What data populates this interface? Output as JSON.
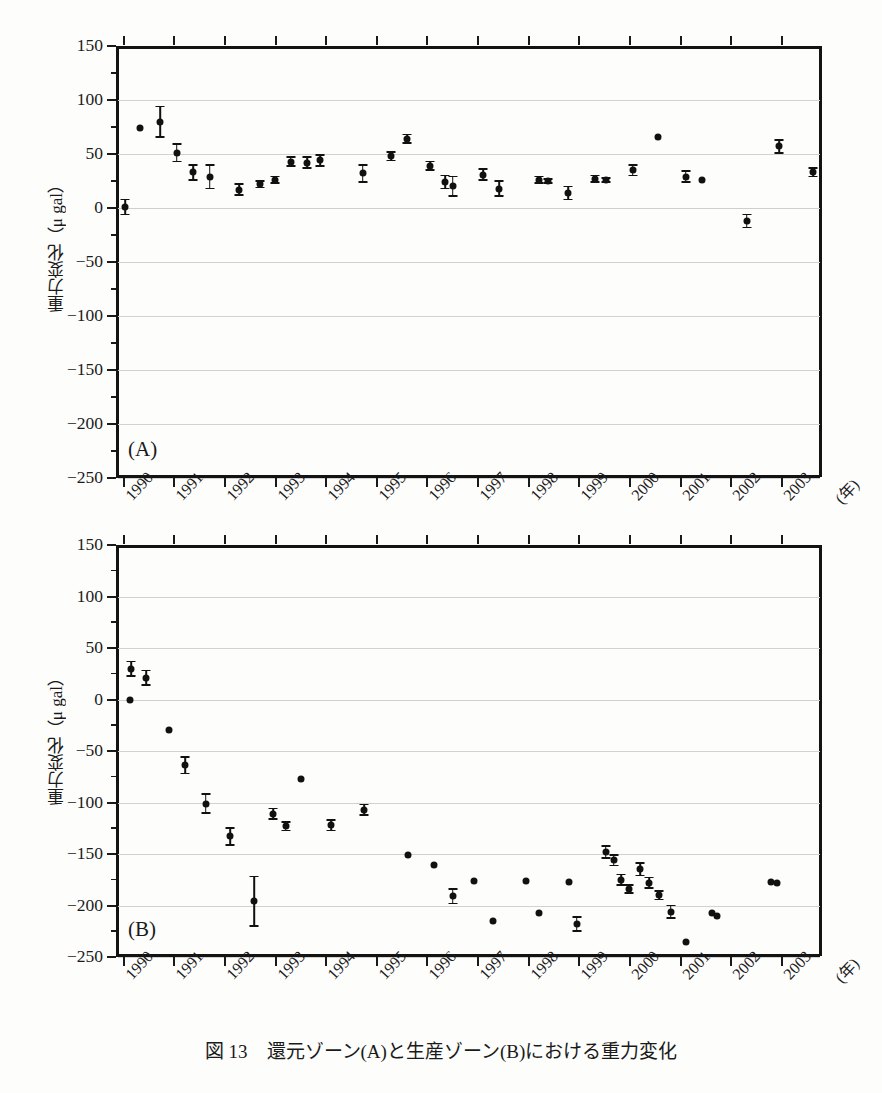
{
  "figure": {
    "caption": "図 13　還元ゾーン(A)と生産ゾーン(B)における重力変化",
    "cut_header_text": "",
    "axis_title_y": "重力変化（μ gal）",
    "unit_x": "(年)"
  },
  "panels": [
    {
      "tag": "(A)",
      "name": "reinjection-zone"
    },
    {
      "tag": "(B)",
      "name": "production-zone"
    }
  ],
  "axes": {
    "y_ticks": [
      "150",
      "100",
      "50",
      "0",
      "-50",
      "-100",
      "-150",
      "-200",
      "-250"
    ],
    "y_values": [
      150,
      100,
      50,
      0,
      -50,
      -100,
      -150,
      -200,
      -250
    ],
    "x_ticks": [
      "1990",
      "1991",
      "1992",
      "1993",
      "1994",
      "1995",
      "1996",
      "1997",
      "1998",
      "1999",
      "2000",
      "2001",
      "2002",
      "2003"
    ],
    "x_values": [
      1990,
      1991,
      1992,
      1993,
      1994,
      1995,
      1996,
      1997,
      1998,
      1999,
      2000,
      2001,
      2002,
      2003
    ]
  },
  "chart_data": [
    {
      "type": "scatter",
      "title": "(A) 還元ゾーン",
      "xlabel": "(年)",
      "ylabel": "重力変化（μ gal）",
      "xlim": [
        1989.85,
        2003.75
      ],
      "ylim": [
        -250,
        150
      ],
      "grid": true,
      "legend": "none",
      "errorbars": true,
      "points": [
        {
          "x": 1990.03,
          "y": 1,
          "yerr": 7
        },
        {
          "x": 1990.33,
          "y": 74,
          "yerr": 0
        },
        {
          "x": 1990.72,
          "y": 80,
          "yerr": 14
        },
        {
          "x": 1991.05,
          "y": 51,
          "yerr": 8
        },
        {
          "x": 1991.38,
          "y": 33,
          "yerr": 7
        },
        {
          "x": 1991.7,
          "y": 29,
          "yerr": 11
        },
        {
          "x": 1992.28,
          "y": 17,
          "yerr": 5
        },
        {
          "x": 1992.7,
          "y": 22,
          "yerr": 3
        },
        {
          "x": 1992.98,
          "y": 26,
          "yerr": 3
        },
        {
          "x": 1993.3,
          "y": 43,
          "yerr": 4
        },
        {
          "x": 1993.62,
          "y": 42,
          "yerr": 5
        },
        {
          "x": 1993.88,
          "y": 44,
          "yerr": 5
        },
        {
          "x": 1994.72,
          "y": 32,
          "yerr": 8
        },
        {
          "x": 1995.28,
          "y": 48,
          "yerr": 4
        },
        {
          "x": 1995.6,
          "y": 64,
          "yerr": 4
        },
        {
          "x": 1996.05,
          "y": 39,
          "yerr": 4
        },
        {
          "x": 1996.35,
          "y": 24,
          "yerr": 6
        },
        {
          "x": 1996.5,
          "y": 20,
          "yerr": 9
        },
        {
          "x": 1997.1,
          "y": 31,
          "yerr": 5
        },
        {
          "x": 1997.42,
          "y": 18,
          "yerr": 7
        },
        {
          "x": 1998.2,
          "y": 26,
          "yerr": 3
        },
        {
          "x": 1998.38,
          "y": 25,
          "yerr": 2
        },
        {
          "x": 1998.78,
          "y": 14,
          "yerr": 6
        },
        {
          "x": 1999.3,
          "y": 27,
          "yerr": 3
        },
        {
          "x": 1999.52,
          "y": 26,
          "yerr": 2
        },
        {
          "x": 2000.05,
          "y": 35,
          "yerr": 5
        },
        {
          "x": 2000.55,
          "y": 66,
          "yerr": 0
        },
        {
          "x": 2001.1,
          "y": 29,
          "yerr": 5
        },
        {
          "x": 2001.42,
          "y": 26,
          "yerr": 0
        },
        {
          "x": 2002.3,
          "y": -12,
          "yerr": 6
        },
        {
          "x": 2002.95,
          "y": 57,
          "yerr": 6
        },
        {
          "x": 2003.62,
          "y": 33,
          "yerr": 4
        }
      ]
    },
    {
      "type": "scatter",
      "title": "(B) 生産ゾーン",
      "xlabel": "(年)",
      "ylabel": "重力変化（μ gal）",
      "xlim": [
        1989.85,
        2003.75
      ],
      "ylim": [
        -250,
        150
      ],
      "grid": true,
      "legend": "none",
      "errorbars": true,
      "points": [
        {
          "x": 1990.12,
          "y": 0,
          "yerr": 0
        },
        {
          "x": 1990.15,
          "y": 30,
          "yerr": 7
        },
        {
          "x": 1990.45,
          "y": 21,
          "yerr": 7
        },
        {
          "x": 1990.9,
          "y": -30,
          "yerr": 0
        },
        {
          "x": 1991.22,
          "y": -64,
          "yerr": 8
        },
        {
          "x": 1991.62,
          "y": -101,
          "yerr": 9
        },
        {
          "x": 1992.1,
          "y": -133,
          "yerr": 8
        },
        {
          "x": 1992.58,
          "y": -196,
          "yerr": 24
        },
        {
          "x": 1992.95,
          "y": -111,
          "yerr": 5
        },
        {
          "x": 1993.2,
          "y": -123,
          "yerr": 4
        },
        {
          "x": 1993.5,
          "y": -77,
          "yerr": 0
        },
        {
          "x": 1994.1,
          "y": -122,
          "yerr": 5
        },
        {
          "x": 1994.75,
          "y": -107,
          "yerr": 5
        },
        {
          "x": 1995.62,
          "y": -151,
          "yerr": 0
        },
        {
          "x": 1996.12,
          "y": -161,
          "yerr": 0
        },
        {
          "x": 1996.5,
          "y": -191,
          "yerr": 7
        },
        {
          "x": 1996.92,
          "y": -176,
          "yerr": 0
        },
        {
          "x": 1997.3,
          "y": -215,
          "yerr": 0
        },
        {
          "x": 1997.95,
          "y": -176,
          "yerr": 0
        },
        {
          "x": 1998.2,
          "y": -207,
          "yerr": 0
        },
        {
          "x": 1998.8,
          "y": -177,
          "yerr": 0
        },
        {
          "x": 1998.95,
          "y": -218,
          "yerr": 7
        },
        {
          "x": 1999.52,
          "y": -148,
          "yerr": 6
        },
        {
          "x": 1999.68,
          "y": -156,
          "yerr": 5
        },
        {
          "x": 1999.82,
          "y": -175,
          "yerr": 5
        },
        {
          "x": 1999.98,
          "y": -184,
          "yerr": 4
        },
        {
          "x": 2000.2,
          "y": -165,
          "yerr": 6
        },
        {
          "x": 2000.38,
          "y": -178,
          "yerr": 5
        },
        {
          "x": 2000.58,
          "y": -190,
          "yerr": 4
        },
        {
          "x": 2000.8,
          "y": -206,
          "yerr": 6
        },
        {
          "x": 2001.1,
          "y": -235,
          "yerr": 0
        },
        {
          "x": 2001.62,
          "y": -207,
          "yerr": 0
        },
        {
          "x": 2001.72,
          "y": -210,
          "yerr": 0
        },
        {
          "x": 2002.78,
          "y": -177,
          "yerr": 0
        },
        {
          "x": 2002.9,
          "y": -178,
          "yerr": 0
        }
      ]
    }
  ]
}
